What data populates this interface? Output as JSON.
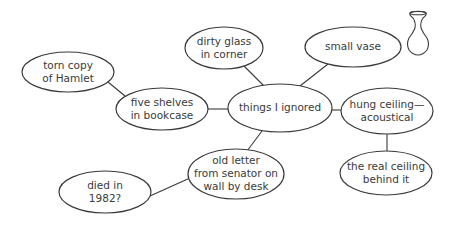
{
  "diagram": {
    "type": "mind-map",
    "center": {
      "id": "things_ignored",
      "lines": [
        "things I ignored"
      ],
      "cx": 280,
      "cy": 108,
      "rx": 52,
      "ry": 24
    },
    "nodes": [
      {
        "id": "dirty_glass",
        "lines": [
          "dirty glass",
          "in corner"
        ],
        "cx": 224,
        "cy": 48,
        "rx": 39,
        "ry": 21
      },
      {
        "id": "small_vase",
        "lines": [
          "small vase"
        ],
        "cx": 353,
        "cy": 47,
        "rx": 48,
        "ry": 20
      },
      {
        "id": "hung_ceiling",
        "lines": [
          "hung ceiling—",
          "acoustical"
        ],
        "cx": 387,
        "cy": 111,
        "rx": 46,
        "ry": 23
      },
      {
        "id": "real_ceiling",
        "lines": [
          "the real ceiling",
          "behind it"
        ],
        "cx": 386,
        "cy": 173,
        "rx": 46,
        "ry": 22
      },
      {
        "id": "old_letter",
        "lines": [
          "old letter",
          "from senator on",
          "wall by desk"
        ],
        "cx": 236,
        "cy": 174,
        "rx": 48,
        "ry": 25
      },
      {
        "id": "died_1982",
        "lines": [
          "died in",
          "1982?"
        ],
        "cx": 105,
        "cy": 192,
        "rx": 46,
        "ry": 21
      },
      {
        "id": "five_shelves",
        "lines": [
          "five shelves",
          "in bookcase"
        ],
        "cx": 162,
        "cy": 109,
        "rx": 46,
        "ry": 21
      },
      {
        "id": "torn_hamlet",
        "lines": [
          "torn copy",
          "of Hamlet"
        ],
        "cx": 68,
        "cy": 72,
        "rx": 46,
        "ry": 20
      }
    ],
    "edges": [
      {
        "from": "things_ignored",
        "to": "dirty_glass",
        "x1": 264,
        "y1": 86,
        "x2": 244,
        "y2": 66
      },
      {
        "from": "things_ignored",
        "to": "small_vase",
        "x1": 300,
        "y1": 86,
        "x2": 328,
        "y2": 64
      },
      {
        "from": "things_ignored",
        "to": "hung_ceiling",
        "x1": 332,
        "y1": 110,
        "x2": 341,
        "y2": 110
      },
      {
        "from": "hung_ceiling",
        "to": "real_ceiling",
        "x1": 387,
        "y1": 134,
        "x2": 387,
        "y2": 151
      },
      {
        "from": "things_ignored",
        "to": "old_letter",
        "x1": 262,
        "y1": 131,
        "x2": 247,
        "y2": 151
      },
      {
        "from": "old_letter",
        "to": "died_1982",
        "x1": 190,
        "y1": 178,
        "x2": 150,
        "y2": 196
      },
      {
        "from": "things_ignored",
        "to": "five_shelves",
        "x1": 208,
        "y1": 109,
        "x2": 228,
        "y2": 109
      },
      {
        "from": "five_shelves",
        "to": "torn_hamlet",
        "x1": 125,
        "y1": 96,
        "x2": 108,
        "y2": 82
      }
    ],
    "decorations": [
      {
        "id": "vase_sketch",
        "icon": "vase-icon",
        "x": 418,
        "y": 12
      }
    ],
    "colors": {
      "stroke": "#3a3a3a",
      "text": "#3a3a3a",
      "fill": "#ffffff",
      "background": "#ffffff"
    }
  }
}
